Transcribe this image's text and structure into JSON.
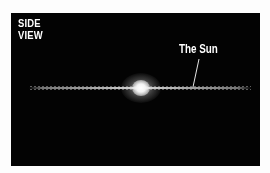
{
  "diagram": {
    "title": "SIDE\nVIEW",
    "annotation": "The Sun",
    "colors": {
      "background": "#030303",
      "text": "#ffffff",
      "page": "#fdfdfd"
    },
    "elements": {
      "galactic_disk": "thin edge-on disk of stars",
      "galactic_bulge": "bright central bulge",
      "sun_marker": "pointer line from label to disk"
    }
  }
}
